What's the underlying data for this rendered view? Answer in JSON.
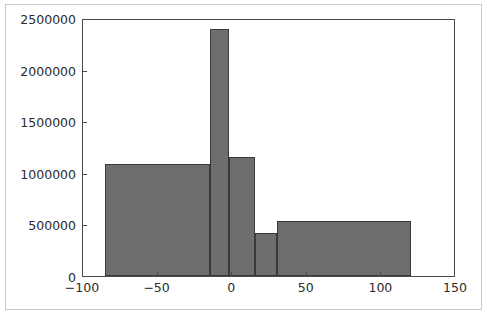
{
  "chart_data": {
    "type": "bar",
    "title": "",
    "xlabel": "",
    "ylabel": "",
    "grid": false,
    "legend": null,
    "xlim": [
      -100,
      150
    ],
    "ylim": [
      0,
      2500000
    ],
    "xticks": [
      -100,
      -50,
      0,
      50,
      100,
      150
    ],
    "xtick_labels": [
      "−100",
      "−50",
      "0",
      "50",
      "100",
      "150"
    ],
    "yticks": [
      0,
      500000,
      1000000,
      1500000,
      2000000,
      2500000
    ],
    "ytick_labels": [
      "0",
      "500000",
      "1000000",
      "1500000",
      "2000000",
      "2500000"
    ],
    "bar_color": "#6e6e6e",
    "bar_edge_color": "#3a3a3a",
    "axes_color": "#4a4a4a",
    "bins": [
      {
        "left": -85,
        "right": -15,
        "value": 1090000
      },
      {
        "left": -15,
        "right": -2,
        "value": 2390000
      },
      {
        "left": -2,
        "right": 15,
        "value": 1150000
      },
      {
        "left": 15,
        "right": 30,
        "value": 420000
      },
      {
        "left": 30,
        "right": 120,
        "value": 530000
      }
    ],
    "bin_edges": [
      -85,
      -15,
      -2,
      15,
      30,
      120
    ],
    "values": [
      1090000,
      2390000,
      1150000,
      420000,
      530000
    ]
  }
}
